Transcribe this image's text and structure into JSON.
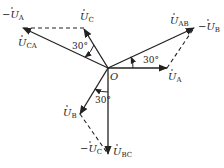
{
  "diagram": {
    "type": "phasor-diagram",
    "origin_label": "O",
    "phasors": [
      {
        "name": "U_A",
        "label": "U",
        "sub": "A",
        "prefix": "",
        "style": "solid"
      },
      {
        "name": "U_B",
        "label": "U",
        "sub": "B",
        "prefix": "",
        "style": "solid"
      },
      {
        "name": "U_C",
        "label": "U",
        "sub": "C",
        "prefix": "",
        "style": "solid"
      },
      {
        "name": "U_AB",
        "label": "U",
        "sub": "AB",
        "prefix": "",
        "style": "solid"
      },
      {
        "name": "U_BC",
        "label": "U",
        "sub": "BC",
        "prefix": "",
        "style": "solid"
      },
      {
        "name": "U_CA",
        "label": "U",
        "sub": "CA",
        "prefix": "",
        "style": "solid"
      },
      {
        "name": "-U_A",
        "label": "U",
        "sub": "A",
        "prefix": "−",
        "style": "dashed"
      },
      {
        "name": "-U_B",
        "label": "U",
        "sub": "B",
        "prefix": "−",
        "style": "dashed"
      },
      {
        "name": "-U_C",
        "label": "U",
        "sub": "C",
        "prefix": "−",
        "style": "dashed"
      }
    ],
    "angles": [
      {
        "between": "U_A / U_AB",
        "label": "30°"
      },
      {
        "between": "U_C / U_CA",
        "label": "30°"
      },
      {
        "between": "U_B / U_BC",
        "label": "30°"
      }
    ]
  }
}
